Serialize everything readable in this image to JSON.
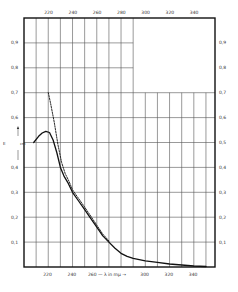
{
  "chart_data": {
    "type": "line",
    "title": "",
    "xlabel": "λ in mμ",
    "ylabel": "ε · 10⁻⁴",
    "ylabel_display": "E ↑ cm",
    "xlim": [
      200,
      358
    ],
    "ylim": [
      0,
      1.0
    ],
    "grid": true,
    "legend": null,
    "x_ticks_top": [
      220,
      240,
      260,
      280,
      300,
      320,
      340
    ],
    "x_ticks_bottom": [
      220,
      240,
      260,
      300,
      320,
      340
    ],
    "x_label_bottom_text": "260 — λ in mμ →",
    "y_ticks_left": [
      "0,9",
      "0,8",
      "0,7",
      "0,6",
      "",
      "0,4",
      "0,3",
      "0,2",
      "0,1"
    ],
    "y_ticks_right": [
      "0,9",
      "0,8",
      "0,7",
      "0,6",
      "0,5",
      "0,4",
      "0,3",
      "0,2",
      "0,1"
    ],
    "y_tick_values": [
      0.9,
      0.8,
      0.7,
      0.6,
      0.5,
      0.4,
      0.3,
      0.2,
      0.1
    ],
    "series": [
      {
        "name": "measured",
        "style": "solid",
        "x": [
          208,
          212,
          215,
          218,
          221,
          224,
          227,
          230,
          233,
          236,
          240,
          245,
          250,
          255,
          260,
          265,
          270,
          275,
          280,
          285,
          290,
          300,
          310,
          320,
          330,
          340,
          350
        ],
        "y": [
          0.5,
          0.525,
          0.538,
          0.545,
          0.54,
          0.51,
          0.46,
          0.4,
          0.365,
          0.34,
          0.3,
          0.265,
          0.23,
          0.195,
          0.16,
          0.125,
          0.1,
          0.075,
          0.055,
          0.043,
          0.035,
          0.025,
          0.019,
          0.012,
          0.008,
          0.004,
          0.002
        ]
      },
      {
        "name": "extrapolated",
        "style": "dashed",
        "x": [
          220,
          222,
          225,
          228,
          231,
          234,
          237,
          240,
          245,
          250,
          255,
          260,
          265,
          270
        ],
        "y": [
          0.7,
          0.655,
          0.58,
          0.49,
          0.42,
          0.375,
          0.345,
          0.31,
          0.275,
          0.24,
          0.205,
          0.168,
          0.132,
          0.105
        ]
      }
    ]
  }
}
